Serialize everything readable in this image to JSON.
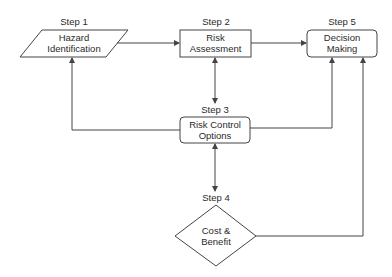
{
  "diagram": {
    "type": "flowchart",
    "colors": {
      "stroke": "#444444",
      "background": "#ffffff",
      "text": "#2a2a2a"
    },
    "nodes": [
      {
        "id": "step1",
        "step": "Step 1",
        "line1": "Hazard",
        "line2": "Identification",
        "shape": "parallelogram"
      },
      {
        "id": "step2",
        "step": "Step 2",
        "line1": "Risk",
        "line2": "Assessment",
        "shape": "rectangle"
      },
      {
        "id": "step3",
        "step": "Step 3",
        "line1": "Risk Control",
        "line2": "Options",
        "shape": "rounded-rectangle"
      },
      {
        "id": "step4",
        "step": "Step 4",
        "line1": "Cost &",
        "line2": "Benefit",
        "shape": "diamond"
      },
      {
        "id": "step5",
        "step": "Step 5",
        "line1": "Decision",
        "line2": "Making",
        "shape": "rounded-rectangle"
      }
    ],
    "edges": [
      {
        "from": "step1",
        "to": "step2",
        "direction": "forward"
      },
      {
        "from": "step2",
        "to": "step5",
        "direction": "forward"
      },
      {
        "from": "step2",
        "to": "step3",
        "direction": "bidirectional"
      },
      {
        "from": "step3",
        "to": "step1",
        "direction": "forward"
      },
      {
        "from": "step3",
        "to": "step5",
        "direction": "forward"
      },
      {
        "from": "step3",
        "to": "step4",
        "direction": "bidirectional"
      },
      {
        "from": "step4",
        "to": "step5",
        "direction": "forward"
      }
    ]
  }
}
